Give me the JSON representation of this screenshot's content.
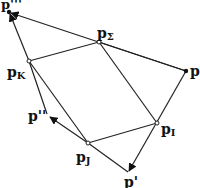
{
  "diagram": {
    "type": "vector-geometry",
    "nodes": [
      {
        "id": "p3",
        "label": "p'''",
        "x": 9,
        "y": 12,
        "style": "filled"
      },
      {
        "id": "pS",
        "label": "p",
        "sub": "Σ",
        "x": 99,
        "y": 42,
        "style": "open"
      },
      {
        "id": "p",
        "label": "p",
        "x": 186,
        "y": 71,
        "style": "filled"
      },
      {
        "id": "pK",
        "label": "p",
        "sub": "K",
        "x": 29,
        "y": 61,
        "style": "open"
      },
      {
        "id": "p2",
        "label": "p''",
        "x": 49,
        "y": 116,
        "style": "arrow-tip"
      },
      {
        "id": "pJ",
        "label": "p",
        "sub": "J",
        "x": 88,
        "y": 143,
        "style": "open"
      },
      {
        "id": "pI",
        "label": "p",
        "sub": "I",
        "x": 157,
        "y": 123,
        "style": "open"
      },
      {
        "id": "p1",
        "label": "p'",
        "x": 128,
        "y": 173,
        "style": "arrow-tip"
      }
    ],
    "edges": [
      {
        "from": "p",
        "to": "p3",
        "arrow": true
      },
      {
        "from": "pK",
        "to": "p3",
        "arrow": true
      },
      {
        "from": "pK",
        "to": "pS",
        "arrow": false
      },
      {
        "from": "pS",
        "to": "p",
        "arrow": false
      },
      {
        "from": "p",
        "to": "p1",
        "arrow": true
      },
      {
        "from": "pJ",
        "to": "p2",
        "arrow": true
      },
      {
        "from": "pK",
        "to": "p2",
        "arrow": false
      },
      {
        "from": "pK",
        "to": "pJ",
        "arrow": false
      },
      {
        "from": "pS",
        "to": "pI",
        "arrow": false
      },
      {
        "from": "pJ",
        "to": "pI",
        "arrow": false
      },
      {
        "from": "pJ",
        "to": "p1",
        "arrow": false
      }
    ],
    "labels": {
      "p3": "p'''",
      "pS_base": "p",
      "pS_sub": "Σ",
      "p": "p",
      "pK_base": "p",
      "pK_sub": "K",
      "p2": "p''",
      "pJ_base": "p",
      "pJ_sub": "J",
      "pI_base": "p",
      "pI_sub": "I",
      "p1": "p'"
    }
  }
}
